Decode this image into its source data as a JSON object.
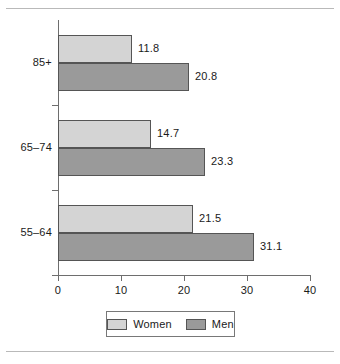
{
  "chart_data": {
    "type": "bar",
    "orientation": "horizontal",
    "title": "",
    "xlabel": "",
    "ylabel": "",
    "xlim": [
      0,
      40
    ],
    "xticks": [
      0,
      10,
      20,
      30,
      40
    ],
    "xtick_labels": [
      "0",
      "10",
      "20",
      "30",
      "40"
    ],
    "grid": false,
    "legend_position": "bottom",
    "categories": [
      "85+",
      "65–74",
      "55–64"
    ],
    "series": [
      {
        "name": "Women",
        "color": "#d4d4d4",
        "values": [
          11.8,
          14.7,
          21.5
        ],
        "value_labels": [
          "11.8",
          "14.7",
          "21.5"
        ]
      },
      {
        "name": "Men",
        "color": "#9a9a9a",
        "values": [
          20.8,
          23.3,
          31.1
        ],
        "value_labels": [
          "20.8",
          "23.3",
          "31.1"
        ]
      }
    ]
  },
  "legend": {
    "items": [
      {
        "label": "Women",
        "swatch": "women"
      },
      {
        "label": "Men",
        "swatch": "men"
      }
    ]
  },
  "colors": {
    "women_fill": "#d4d4d4",
    "men_fill": "#9a9a9a",
    "bar_border": "#555555",
    "axis": "#6e6e6e",
    "rule": "#b9b9b9",
    "text": "#1a1a1a",
    "background": "#ffffff"
  }
}
